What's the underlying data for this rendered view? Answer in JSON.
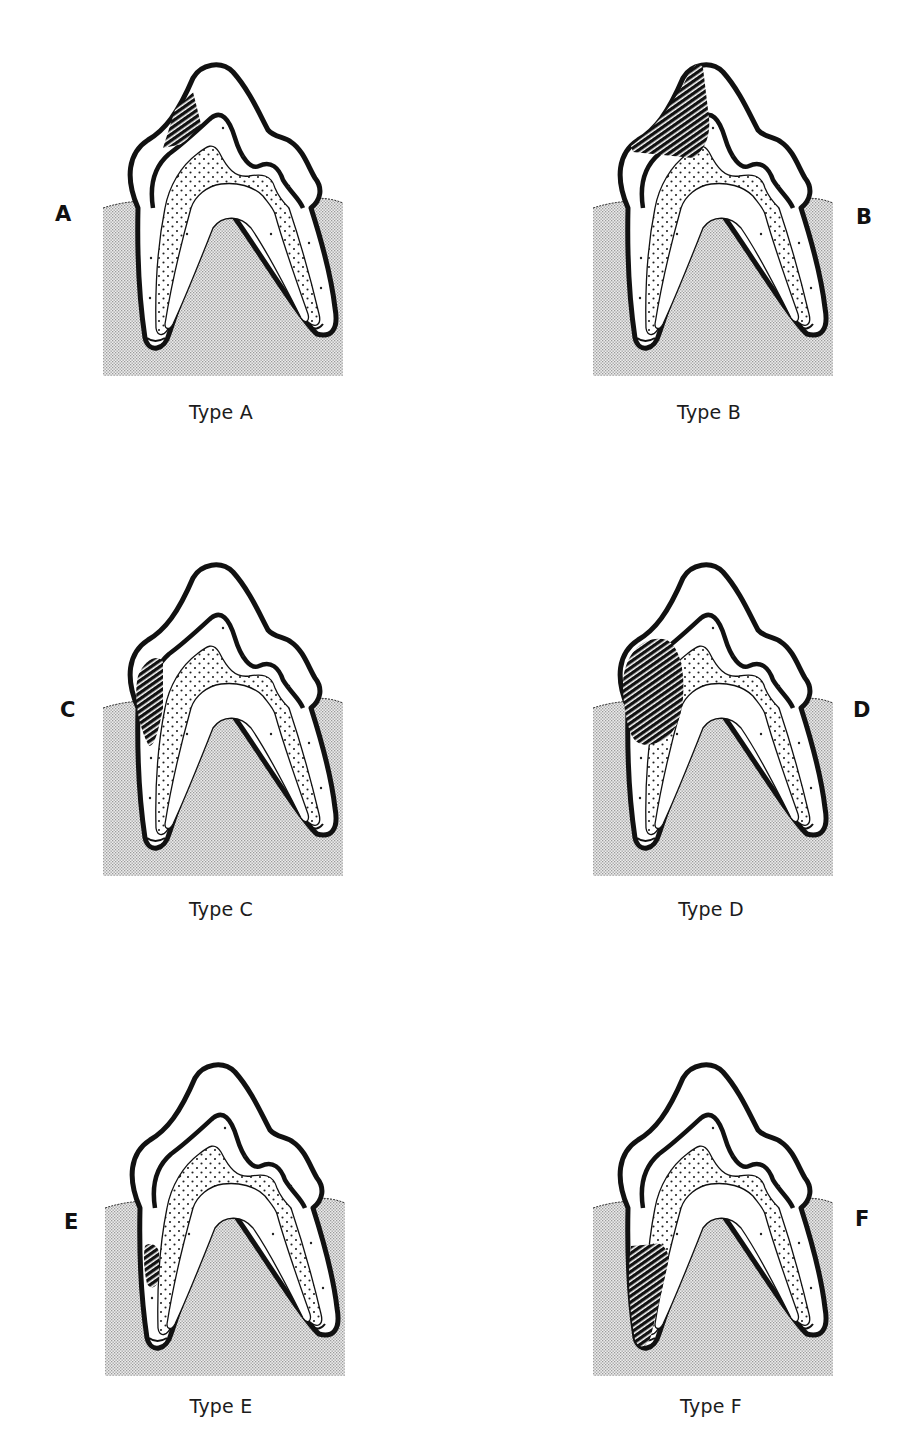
{
  "figure": {
    "title": "",
    "panels": [
      {
        "id": "A",
        "letter": "A",
        "caption": "Type A",
        "lesion_position": "crown cusp slope (upper enamel, mesial)"
      },
      {
        "id": "B",
        "letter": "B",
        "caption": "Type B",
        "lesion_position": "large crown lesion from cusp tip through enamel into dentin"
      },
      {
        "id": "C",
        "letter": "C",
        "caption": "Type C",
        "lesion_position": "cervical crown at gum line (enamel-cementum junction)"
      },
      {
        "id": "D",
        "letter": "D",
        "caption": "Type D",
        "lesion_position": "large cervical lesion extending into dentin below gum line"
      },
      {
        "id": "E",
        "letter": "E",
        "caption": "Type E",
        "lesion_position": "small lesion on root surface below gum line"
      },
      {
        "id": "F",
        "letter": "F",
        "caption": "Type F",
        "lesion_position": "extensive root lesion along mesial root"
      }
    ]
  },
  "legend_colors": {
    "outline": "#111111",
    "gum_fill": "#d9d9d9",
    "dentin_dots": "#222222",
    "lesion_hatch": "#111111",
    "background": "#ffffff"
  }
}
